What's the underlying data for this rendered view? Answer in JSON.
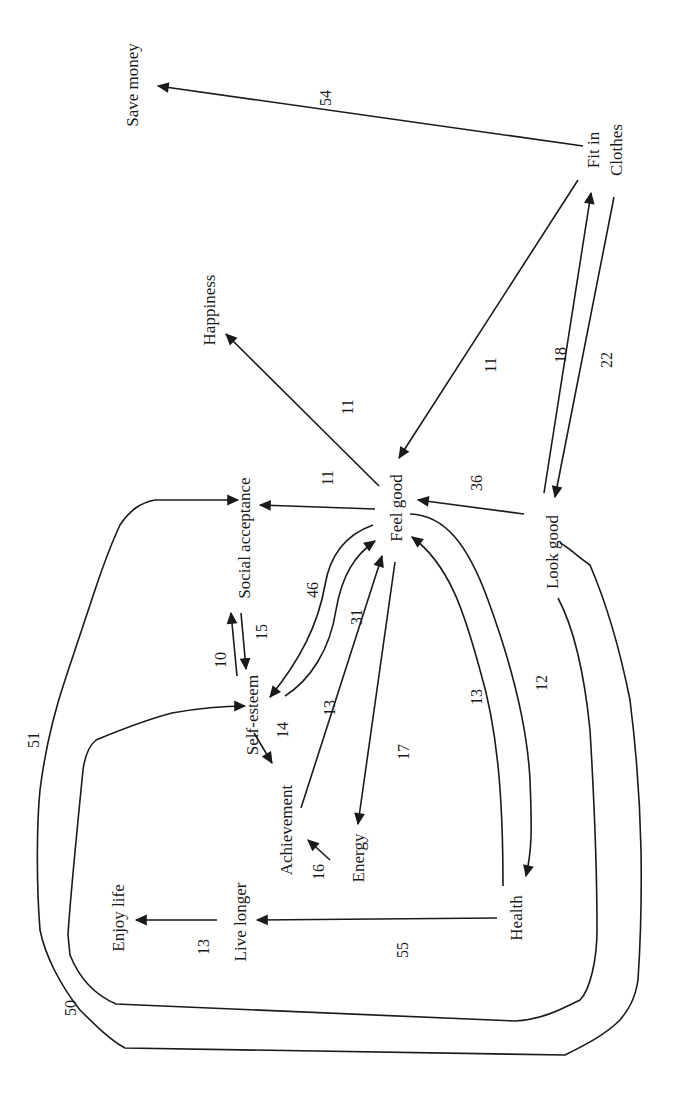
{
  "diagram": {
    "type": "means-end chain / implication network",
    "orientation": "rotated 90deg counter-clockwise",
    "colors": {
      "ink": "#1a1a1a",
      "background": "#ffffff"
    },
    "nodes": [
      {
        "id": "save_money",
        "label": "Save money",
        "x": 132,
        "y": 50
      },
      {
        "id": "fit_in_clothes_1",
        "label": "Fit in",
        "x": 593,
        "y": 140
      },
      {
        "id": "fit_in_clothes_2",
        "label": "Clothes",
        "x": 617,
        "y": 150
      },
      {
        "id": "happiness",
        "label": "Happiness",
        "x": 210,
        "y": 305
      },
      {
        "id": "social_acceptance",
        "label": "Social acceptance",
        "x": 244,
        "y": 538
      },
      {
        "id": "feel_good",
        "label": "Feel good",
        "x": 396,
        "y": 495
      },
      {
        "id": "look_good",
        "label": "Look good",
        "x": 553,
        "y": 552
      },
      {
        "id": "self_esteem",
        "label": "Self-esteem",
        "x": 254,
        "y": 715
      },
      {
        "id": "achievement",
        "label": "Achievement",
        "x": 288,
        "y": 832
      },
      {
        "id": "energy",
        "label": "Energy",
        "x": 363,
        "y": 860
      },
      {
        "id": "enjoy_life",
        "label": "Enjoy life",
        "x": 126,
        "y": 880
      },
      {
        "id": "live_longer",
        "label": "Live longer",
        "x": 248,
        "y": 912
      },
      {
        "id": "health",
        "label": "Health",
        "x": 521,
        "y": 900
      }
    ],
    "edges": [
      {
        "from": "Fit in Clothes",
        "to": "Save money",
        "weight": "54",
        "lx": 325,
        "ly": 98
      },
      {
        "from": "Fit in Clothes",
        "to": "Feel good",
        "weight": "11",
        "lx": 490,
        "ly": 365
      },
      {
        "from": "Look good",
        "to": "Fit in Clothes",
        "weight": "18",
        "lx": 560,
        "ly": 355
      },
      {
        "from": "Fit in Clothes",
        "to": "Look good",
        "weight": "22",
        "lx": 607,
        "ly": 360
      },
      {
        "from": "Feel good",
        "to": "Happiness",
        "weight": "11",
        "lx": 347,
        "ly": 407
      },
      {
        "from": "Feel good",
        "to": "Social acceptance",
        "weight": "11",
        "lx": 327,
        "ly": 478
      },
      {
        "from": "Look good",
        "to": "Feel good",
        "weight": "36",
        "lx": 476,
        "ly": 483
      },
      {
        "from": "Feel good",
        "to": "Self-esteem",
        "weight": "46",
        "lx": 312,
        "ly": 590
      },
      {
        "from": "Self-esteem",
        "to": "Feel good",
        "weight": "31",
        "lx": 356,
        "ly": 617
      },
      {
        "from": "Self-esteem",
        "to": "Social acceptance",
        "weight": "10",
        "lx": 220,
        "ly": 660
      },
      {
        "from": "Social acceptance",
        "to": "Self-esteem",
        "weight": "15",
        "lx": 261,
        "ly": 632
      },
      {
        "from": "Self-esteem",
        "to": "Achievement",
        "weight": "14",
        "lx": 282,
        "ly": 730
      },
      {
        "from": "Achievement",
        "to": "Feel good",
        "weight": "13",
        "lx": 329,
        "ly": 708
      },
      {
        "from": "Feel good",
        "to": "Energy",
        "weight": "17",
        "lx": 403,
        "ly": 752
      },
      {
        "from": "Health",
        "to": "Feel good",
        "weight": "13",
        "lx": 476,
        "ly": 697
      },
      {
        "from": "Feel good",
        "to": "Health",
        "weight": "12",
        "lx": 541,
        "ly": 683
      },
      {
        "from": "Energy",
        "to": "Achievement",
        "weight": "16",
        "lx": 318,
        "ly": 872
      },
      {
        "from": "Live longer",
        "to": "Enjoy life",
        "weight": "13",
        "lx": 203,
        "ly": 947
      },
      {
        "from": "Health",
        "to": "Live longer",
        "weight": "55",
        "lx": 402,
        "ly": 950
      },
      {
        "from": "Look good",
        "to": "Self-esteem",
        "weight": "50",
        "lx": 70,
        "ly": 1008
      },
      {
        "from": "Look good",
        "to": "Social acceptance",
        "weight": "51",
        "lx": 33,
        "ly": 937
      }
    ]
  }
}
